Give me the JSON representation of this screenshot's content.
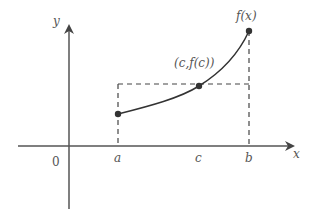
{
  "diagram": {
    "axes": {
      "x_label": "x",
      "y_label": "y",
      "origin_label": "0"
    },
    "ticks": {
      "a": "a",
      "c": "c",
      "b": "b"
    },
    "curve_label": "f(x)",
    "point_label": "(c,f(c))",
    "colors": {
      "axis": "#555555",
      "curve": "#333333",
      "dashed": "#444444",
      "point": "#333333",
      "text": "#555555"
    }
  }
}
